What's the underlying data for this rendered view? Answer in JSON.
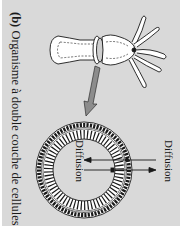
{
  "figure": {
    "label": "(b)",
    "title": "Organisme à double couche de cellules",
    "orientation": "rotated 90° clockwise"
  },
  "labels": {
    "diffusion_inner": "Diffusion",
    "diffusion_outer": "Diffusion"
  },
  "colors": {
    "panel_background": "#d9d9d9",
    "page_background": "#ffffff",
    "line": "#1a1a1a",
    "arrow_fill": "#8c8c8c",
    "organism_fill": "#ffffff"
  },
  "elements": {
    "organism": "hydra (body with tentacles)",
    "cross_section": "ring of two cell layers",
    "pointer": "gray arrow from body section to cross-section",
    "diffusion_arrows": [
      "inward arrow",
      "outward arrow"
    ]
  }
}
